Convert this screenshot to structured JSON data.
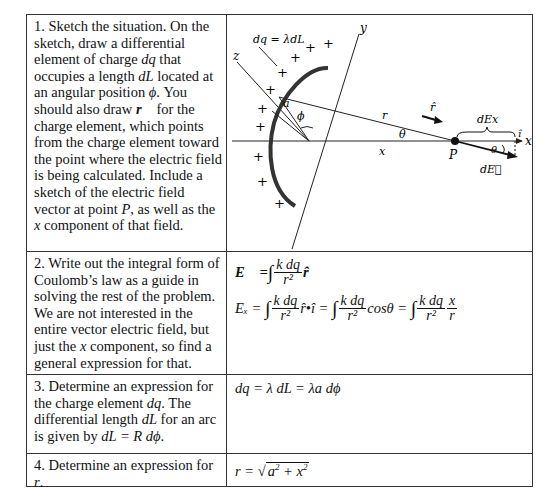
{
  "rows": [
    {
      "step": "1.",
      "prompt_parts": {
        "a": "1.  Sketch the situation.  On the sketch, draw a differential element of charge ",
        "dq": "dq",
        "b": " that occupies a length ",
        "dL": "dL",
        "c": " located at an angular position ",
        "phi": "ϕ",
        "d": ". You should also draw ",
        "rvec": "r⃗",
        "e": " for the charge element, which points from the charge element toward the point where the electric field is being calculated.  Include a sketch of the electric field vector at point ",
        "P": "P",
        "f": ", as well as the ",
        "x": "x",
        "g": " component of that field."
      },
      "diagram": {
        "axis_labels": {
          "y": "y",
          "z": "z",
          "x": "x"
        },
        "charge_label": "dq = λdL",
        "plus_sign": "+",
        "labels": {
          "a": "a",
          "phi": "ϕ",
          "r": "r",
          "theta": "θ",
          "x_dist": "x",
          "P": "P",
          "rhat": "r̂",
          "dEx": "dEx",
          "ihat": "î",
          "dE": "dE⃗",
          "theta2": "θ"
        }
      }
    },
    {
      "step": "2.",
      "prompt_parts": {
        "a": "2.  Write out the integral form of Coulomb’s law as a guide in solving the rest of the problem.  We are not interested in the entire vector electric field, but just the ",
        "x": "x",
        "b": " component, so find a general expression for that."
      },
      "answer": {
        "line1": {
          "lhs": "E⃗ =",
          "int": "∫",
          "num": "k dq",
          "den": "r²",
          "tail": "r̂"
        },
        "line2": {
          "lhs": "Eₓ =",
          "int": "∫",
          "t1_num": "k dq",
          "t1_den": "r²",
          "t1_tail": "r̂•î =",
          "t2_num": "k dq",
          "t2_den": "r²",
          "t2_tail": "cosθ =",
          "t3_num": "k dq",
          "t3_den": "r²",
          "t3_x": "x",
          "t3_r": "r"
        }
      }
    },
    {
      "step": "3.",
      "prompt_parts": {
        "a": "3.  Determine an expression for the charge element ",
        "dq": "dq",
        "b": ". The differential length ",
        "dL": "dL",
        "c": " for an arc is given by ",
        "formula": "dL = R dϕ",
        "d": "."
      },
      "answer": {
        "text": "dq = λ dL = λa dϕ"
      }
    },
    {
      "step": "4.",
      "prompt_parts": {
        "a": "4.  Determine an expression for ",
        "r": "r",
        "b": "."
      },
      "answer": {
        "lhs": "r = ",
        "sqrt_a": "a",
        "sq": "2",
        "plus": " + ",
        "sqrt_x": "x",
        "sq2": "2"
      }
    }
  ]
}
